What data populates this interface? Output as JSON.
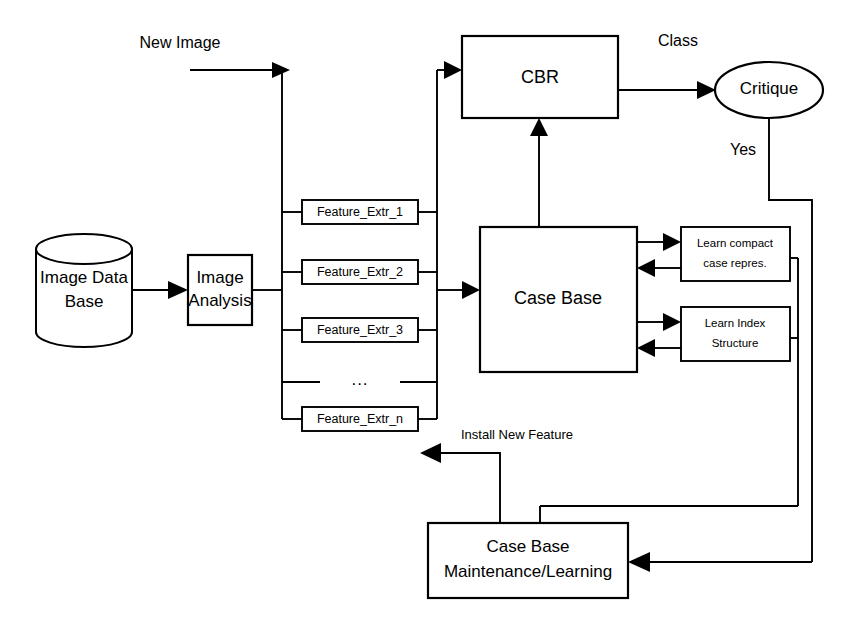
{
  "diagram": {
    "background_color": "#ffffff",
    "line_color": "#000000",
    "nodes": {
      "image_database": {
        "label_line1": "Image Data",
        "label_line2": "Base",
        "shape": "cylinder"
      },
      "image_analysis": {
        "label_line1": "Image",
        "label_line2": "Analysis",
        "shape": "rectangle"
      },
      "cbr": {
        "label": "CBR",
        "shape": "rectangle"
      },
      "critique": {
        "label": "Critique",
        "shape": "ellipse"
      },
      "case_base": {
        "label": "Case Base",
        "shape": "rectangle"
      },
      "learn_compact": {
        "label_line1": "Learn compact",
        "label_line2": "case repres.",
        "shape": "rectangle"
      },
      "learn_index": {
        "label_line1": "Learn Index",
        "label_line2": "Structure",
        "shape": "rectangle"
      },
      "maintenance": {
        "label_line1": "Case Base",
        "label_line2": "Maintenance/Learning",
        "shape": "rectangle"
      }
    },
    "feature_extractors": [
      {
        "label": "Feature_Extr_1"
      },
      {
        "label": "Feature_Extr_2"
      },
      {
        "label": "Feature_Extr_3"
      },
      {
        "label": "Feature_Extr_n"
      }
    ],
    "ellipsis": "...",
    "edge_labels": {
      "new_image": "New Image",
      "class": "Class",
      "yes": "Yes",
      "install_new_feature": "Install New Feature"
    }
  }
}
